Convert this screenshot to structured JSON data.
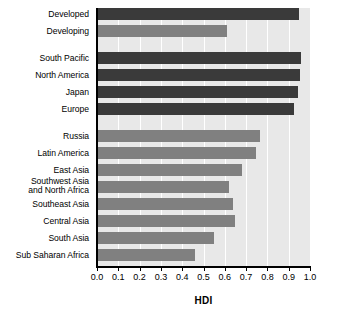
{
  "chart_data": {
    "type": "bar",
    "orientation": "horizontal",
    "title": "",
    "xlabel": "HDI",
    "ylabel": "",
    "xlim": [
      0.0,
      1.0
    ],
    "xticks": [
      "0.0",
      "0.1",
      "0.2",
      "0.3",
      "0.4",
      "0.5",
      "0.6",
      "0.7",
      "0.8",
      "0.9",
      "1.0"
    ],
    "grid": true,
    "legend": "none",
    "categories": [
      "Developed",
      "Developing",
      "South Pacific",
      "North America",
      "Japan",
      "Europe",
      "Russia",
      "Latin America",
      "East Asia",
      "Southwest Asia\nand North Africa",
      "Southeast Asia",
      "Central Asia",
      "South Asia",
      "Sub Saharan Africa"
    ],
    "values": [
      0.95,
      0.61,
      0.96,
      0.955,
      0.945,
      0.925,
      0.765,
      0.745,
      0.68,
      0.62,
      0.64,
      0.65,
      0.55,
      0.46
    ],
    "bars": [
      {
        "label": "Developed",
        "value": 0.95,
        "color": "#3a3a3a",
        "group": 1
      },
      {
        "label": "Developing",
        "value": 0.61,
        "color": "#808080",
        "group": 1
      },
      {
        "label": "South Pacific",
        "value": 0.96,
        "color": "#3a3a3a",
        "group": 2
      },
      {
        "label": "North America",
        "value": 0.955,
        "color": "#3a3a3a",
        "group": 2
      },
      {
        "label": "Japan",
        "value": 0.945,
        "color": "#3a3a3a",
        "group": 2
      },
      {
        "label": "Europe",
        "value": 0.925,
        "color": "#3a3a3a",
        "group": 2
      },
      {
        "label": "Russia",
        "value": 0.765,
        "color": "#808080",
        "group": 3
      },
      {
        "label": "Latin America",
        "value": 0.745,
        "color": "#808080",
        "group": 3
      },
      {
        "label": "East Asia",
        "value": 0.68,
        "color": "#808080",
        "group": 3
      },
      {
        "label": "Southwest Asia\nand North Africa",
        "value": 0.62,
        "color": "#808080",
        "group": 3
      },
      {
        "label": "Southeast Asia",
        "value": 0.64,
        "color": "#808080",
        "group": 3
      },
      {
        "label": "Central Asia",
        "value": 0.65,
        "color": "#808080",
        "group": 3
      },
      {
        "label": "South Asia",
        "value": 0.55,
        "color": "#808080",
        "group": 3
      },
      {
        "label": "Sub Saharan Africa",
        "value": 0.46,
        "color": "#808080",
        "group": 3
      }
    ],
    "colors": {
      "dark_bar": "#3a3a3a",
      "light_bar": "#808080",
      "plot_background": "#e8e8e8",
      "gridline": "#ffffff",
      "axis": "#000000",
      "text": "#000000"
    }
  }
}
